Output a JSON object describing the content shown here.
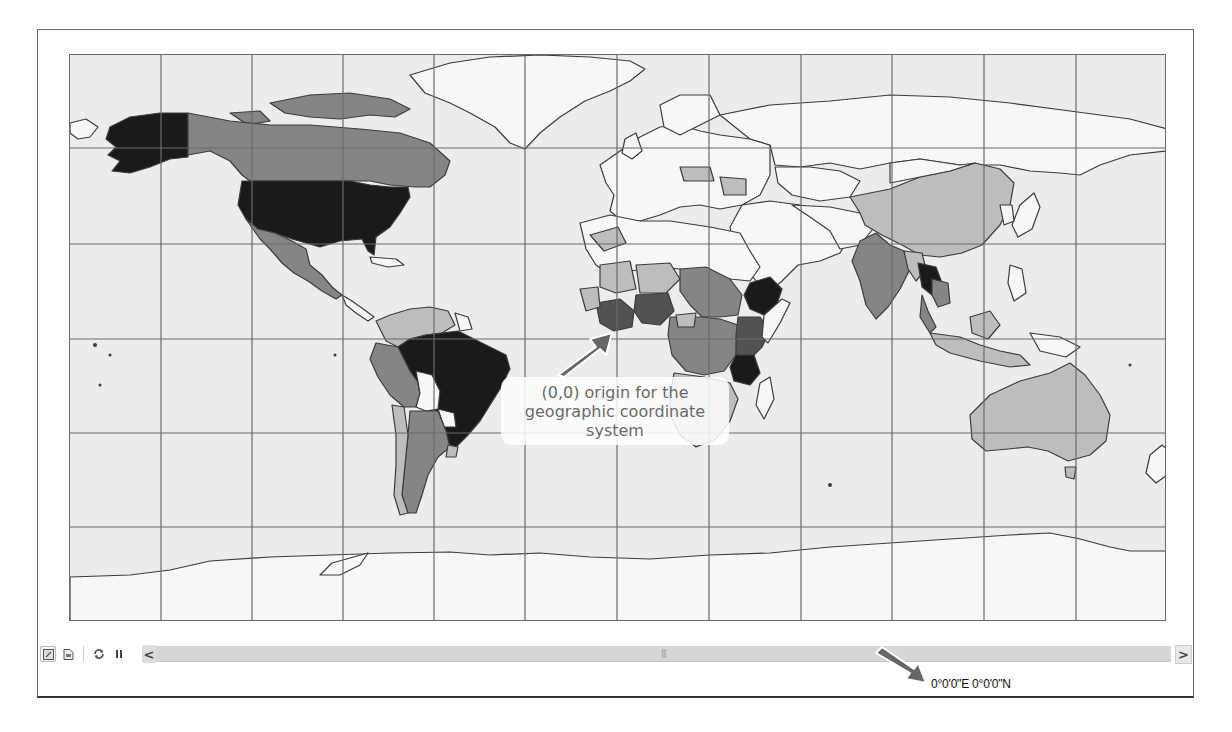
{
  "map": {
    "projection": "Geographic (WGS84) plate carrée",
    "grid_spacing_deg": 30,
    "colors": {
      "ocean": "#ececec",
      "class_0_none": "#f7f7f7",
      "class_1_low": "#bdbdbd",
      "class_2_medium": "#858585",
      "class_3_high": "#525252",
      "class_4_highest": "#1a1a1a",
      "grid": "#6b6b6b",
      "border": "#3c3c3c"
    }
  },
  "annotations": {
    "origin_callout": {
      "line1": "(0,0) origin for the",
      "line2": "geographic coordinate",
      "line3": "system"
    }
  },
  "toolbar": {
    "buttons": [
      {
        "name": "data-view",
        "icon": "map-view-icon",
        "active": true
      },
      {
        "name": "layout-view",
        "icon": "page-layout-icon",
        "active": false
      },
      {
        "name": "refresh",
        "icon": "refresh-icon",
        "active": false
      },
      {
        "name": "pause",
        "icon": "pause-icon",
        "active": false
      }
    ],
    "scroll_left_glyph": "<",
    "scroll_right_glyph": ">",
    "scroll_grip_glyph": "|||"
  },
  "status": {
    "coordinates": "0°0'0\"E  0°0'0\"N"
  }
}
